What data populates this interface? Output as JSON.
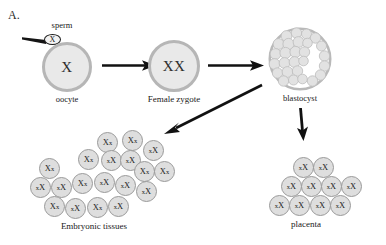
{
  "panel": {
    "letter": "A."
  },
  "colors": {
    "cell_fill": "#e9e9e9",
    "cell_ring": "#b6b6b6",
    "small_cell_fill": "#dedede",
    "small_cell_ring": "#9a9a9a",
    "arrow": "#111111",
    "text": "#1a1a1a",
    "blastocyst_cavity": "#ffffff"
  },
  "stages": {
    "sperm": {
      "label": "sperm",
      "genotype": "X"
    },
    "oocyte": {
      "label": "oocyte",
      "genotype": "X"
    },
    "zygote": {
      "label": "Female zygote",
      "genotype": "XX"
    },
    "blastocyst": {
      "label": "blastocyst"
    },
    "embryonic": {
      "label": "Embryonic tissues"
    },
    "placenta": {
      "label": "placenta"
    }
  },
  "arrows": [
    {
      "name": "oocyte-to-zygote",
      "direction": "right"
    },
    {
      "name": "zygote-to-blastocyst",
      "direction": "right"
    },
    {
      "name": "blastocyst-to-embryonic",
      "direction": "down-left"
    },
    {
      "name": "blastocyst-to-placenta",
      "direction": "down"
    }
  ],
  "embryonic_cells": [
    {
      "x": 97,
      "y": 132,
      "active": "X",
      "inactive": "x",
      "order": "Xx"
    },
    {
      "x": 122,
      "y": 130,
      "active": "X",
      "inactive": "x",
      "order": "Xx"
    },
    {
      "x": 143,
      "y": 140,
      "active": "X",
      "inactive": "x",
      "order": "xX"
    },
    {
      "x": 78,
      "y": 149,
      "active": "X",
      "inactive": "x",
      "order": "Xx"
    },
    {
      "x": 101,
      "y": 150,
      "active": "X",
      "inactive": "x",
      "order": "xX"
    },
    {
      "x": 120,
      "y": 150,
      "active": "X",
      "inactive": "x",
      "order": "xX"
    },
    {
      "x": 39,
      "y": 158,
      "active": "X",
      "inactive": "x",
      "order": "Xx"
    },
    {
      "x": 134,
      "y": 161,
      "active": "X",
      "inactive": "x",
      "order": "Xx"
    },
    {
      "x": 154,
      "y": 161,
      "active": "X",
      "inactive": "x",
      "order": "Xx"
    },
    {
      "x": 30,
      "y": 177,
      "active": "X",
      "inactive": "x",
      "order": "xX"
    },
    {
      "x": 51,
      "y": 177,
      "active": "X",
      "inactive": "x",
      "order": "xX"
    },
    {
      "x": 72,
      "y": 173,
      "active": "X",
      "inactive": "x",
      "order": "Xx"
    },
    {
      "x": 94,
      "y": 172,
      "active": "X",
      "inactive": "x",
      "order": "xX"
    },
    {
      "x": 115,
      "y": 175,
      "active": "X",
      "inactive": "x",
      "order": "xX"
    },
    {
      "x": 136,
      "y": 181,
      "active": "X",
      "inactive": "x",
      "order": "xX"
    },
    {
      "x": 44,
      "y": 196,
      "active": "X",
      "inactive": "x",
      "order": "Xx"
    },
    {
      "x": 65,
      "y": 198,
      "active": "X",
      "inactive": "x",
      "order": "xX"
    },
    {
      "x": 87,
      "y": 197,
      "active": "X",
      "inactive": "x",
      "order": "Xx"
    },
    {
      "x": 108,
      "y": 196,
      "active": "X",
      "inactive": "x",
      "order": "xX"
    }
  ],
  "placenta_cells": [
    {
      "x": 293,
      "y": 157,
      "active": "X",
      "inactive": "x",
      "order": "xX"
    },
    {
      "x": 313,
      "y": 157,
      "active": "X",
      "inactive": "x",
      "order": "xX"
    },
    {
      "x": 281,
      "y": 176,
      "active": "X",
      "inactive": "x",
      "order": "xX"
    },
    {
      "x": 301,
      "y": 176,
      "active": "X",
      "inactive": "x",
      "order": "xX"
    },
    {
      "x": 321,
      "y": 176,
      "active": "X",
      "inactive": "x",
      "order": "xX"
    },
    {
      "x": 341,
      "y": 176,
      "active": "X",
      "inactive": "x",
      "order": "xX"
    },
    {
      "x": 269,
      "y": 195,
      "active": "X",
      "inactive": "x",
      "order": "xX"
    },
    {
      "x": 289,
      "y": 195,
      "active": "X",
      "inactive": "x",
      "order": "xX"
    },
    {
      "x": 310,
      "y": 195,
      "active": "X",
      "inactive": "x",
      "order": "xX"
    },
    {
      "x": 330,
      "y": 195,
      "active": "X",
      "inactive": "x",
      "order": "xX"
    }
  ],
  "blastocyst_cells": [
    {
      "x": 17,
      "y": 6,
      "r": 5.4
    },
    {
      "x": 27,
      "y": 3,
      "r": 5.2
    },
    {
      "x": 37,
      "y": 4,
      "r": 5.0
    },
    {
      "x": 46,
      "y": 8,
      "r": 5.2
    },
    {
      "x": 9,
      "y": 14,
      "r": 5.4
    },
    {
      "x": 19,
      "y": 14,
      "r": 5.6
    },
    {
      "x": 29,
      "y": 12,
      "r": 5.4
    },
    {
      "x": 38,
      "y": 13,
      "r": 4.8
    },
    {
      "x": 52,
      "y": 16,
      "r": 5.0
    },
    {
      "x": 6,
      "y": 24,
      "r": 5.4
    },
    {
      "x": 16,
      "y": 23,
      "r": 5.6
    },
    {
      "x": 26,
      "y": 22,
      "r": 5.6
    },
    {
      "x": 35,
      "y": 22,
      "r": 5.2
    },
    {
      "x": 55,
      "y": 26,
      "r": 5.2
    },
    {
      "x": 5,
      "y": 34,
      "r": 5.4
    },
    {
      "x": 15,
      "y": 33,
      "r": 5.4
    },
    {
      "x": 25,
      "y": 32,
      "r": 5.4
    },
    {
      "x": 34,
      "y": 31,
      "r": 4.8
    },
    {
      "x": 55,
      "y": 36,
      "r": 5.2
    },
    {
      "x": 8,
      "y": 43,
      "r": 5.2
    },
    {
      "x": 18,
      "y": 42,
      "r": 5.4
    },
    {
      "x": 28,
      "y": 41,
      "r": 5.2
    },
    {
      "x": 51,
      "y": 45,
      "r": 5.2
    },
    {
      "x": 14,
      "y": 51,
      "r": 5.2
    },
    {
      "x": 24,
      "y": 50,
      "r": 5.0
    },
    {
      "x": 33,
      "y": 49,
      "r": 4.8
    },
    {
      "x": 43,
      "y": 51,
      "r": 5.2
    }
  ]
}
